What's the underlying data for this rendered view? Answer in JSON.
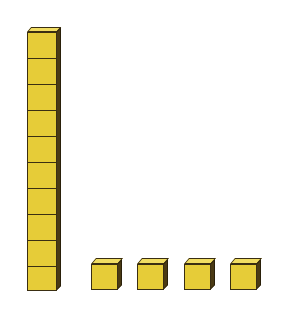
{
  "figure": {
    "rod": {
      "units": 10,
      "label": "ten-rod"
    },
    "cubes": {
      "count": 4,
      "label": "unit cubes"
    },
    "colors": {
      "front": "#e6cc38",
      "top": "#f1dd62",
      "side": "#4a3a14",
      "outline": "#3a2e12"
    }
  }
}
